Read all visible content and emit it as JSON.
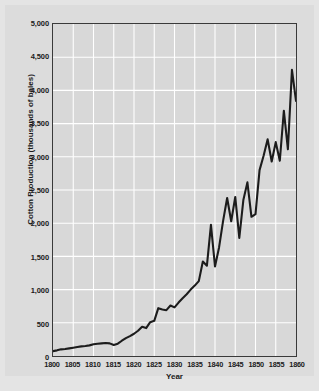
{
  "chart_data": {
    "type": "line",
    "title": "",
    "xlabel": "Year",
    "ylabel": "Cotton Production (thousands of bales)",
    "xlim": [
      1800,
      1860
    ],
    "ylim": [
      0,
      5000
    ],
    "grid": true,
    "legend": "none",
    "line_color": "#1c1c1c",
    "plot_bg": "#d8d8d8",
    "grid_color": "#ffffff",
    "xticks": [
      1800,
      1805,
      1810,
      1815,
      1820,
      1825,
      1830,
      1835,
      1840,
      1845,
      1850,
      1855,
      1860
    ],
    "xtick_labels": [
      "1800",
      "1805",
      "1810",
      "1815",
      "1820",
      "1825",
      "1830",
      "1835",
      "1840",
      "1845",
      "1850",
      "1855",
      "1860"
    ],
    "yticks": [
      0,
      500,
      1000,
      1500,
      2000,
      2500,
      3000,
      3500,
      4000,
      4500,
      5000
    ],
    "ytick_labels": [
      "0",
      "500",
      "1,000",
      "1,500",
      "2,000",
      "2,500",
      "3,000",
      "3,500",
      "4,000",
      "4,500",
      "5,000"
    ],
    "x": [
      1800,
      1801,
      1802,
      1803,
      1804,
      1805,
      1806,
      1807,
      1808,
      1809,
      1810,
      1811,
      1812,
      1813,
      1814,
      1815,
      1816,
      1817,
      1818,
      1819,
      1820,
      1821,
      1822,
      1823,
      1824,
      1825,
      1826,
      1827,
      1828,
      1829,
      1830,
      1831,
      1832,
      1833,
      1834,
      1835,
      1836,
      1837,
      1838,
      1839,
      1840,
      1841,
      1842,
      1843,
      1844,
      1845,
      1846,
      1847,
      1848,
      1849,
      1850,
      1851,
      1852,
      1853,
      1854,
      1855,
      1856,
      1857,
      1858,
      1859,
      1860
    ],
    "values": [
      73,
      85,
      100,
      105,
      115,
      125,
      135,
      145,
      150,
      160,
      178,
      185,
      190,
      195,
      190,
      165,
      185,
      230,
      270,
      300,
      335,
      380,
      440,
      420,
      510,
      530,
      720,
      700,
      690,
      760,
      732,
      805,
      870,
      930,
      1000,
      1060,
      1128,
      1423,
      1360,
      1976,
      1348,
      1635,
      2035,
      2379,
      2030,
      2395,
      1778,
      2348,
      2615,
      2097,
      2136,
      2799,
      3016,
      3263,
      2930,
      3221,
      2940,
      3694,
      3113,
      4309,
      3841
    ]
  },
  "axes": {
    "ytitle": "Cotton Production (thousands of bales)",
    "xtitle": "Year"
  }
}
